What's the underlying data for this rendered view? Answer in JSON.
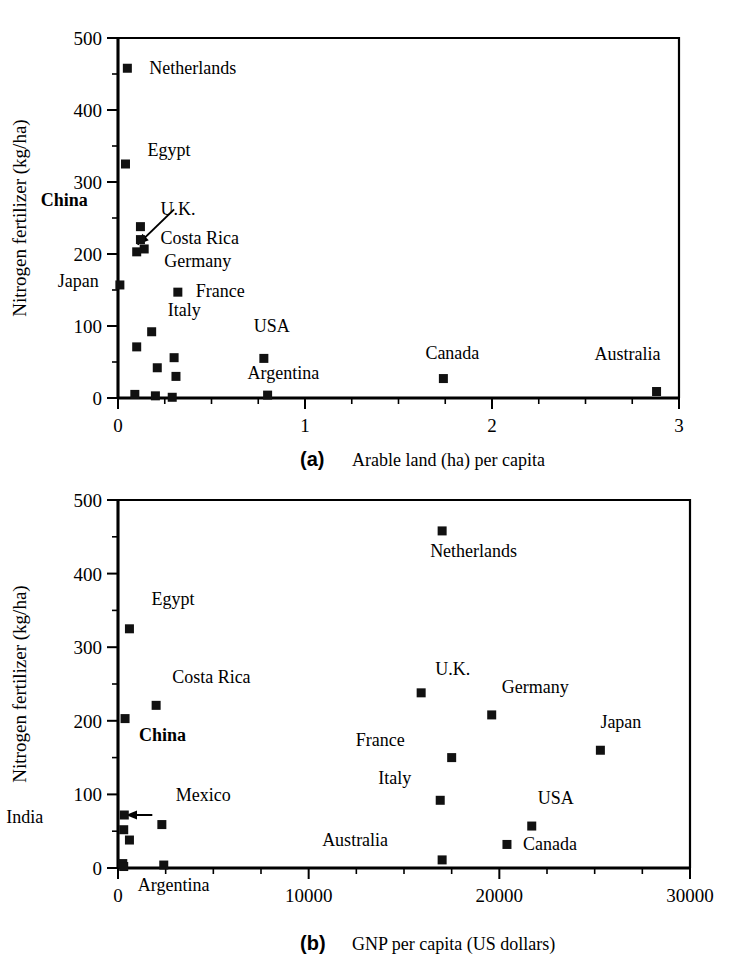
{
  "figure": {
    "background_color": "#ffffff",
    "marker_color": "#111111"
  },
  "chart_data": [
    {
      "type": "scatter",
      "panel_tag": "(a)",
      "title": "",
      "xlabel": "Arable land (ha) per capita",
      "ylabel": "Nitrogen fertilizer (kg/ha)",
      "xlim": [
        0,
        3
      ],
      "ylim": [
        0,
        500
      ],
      "xticks": [
        0,
        1,
        2,
        3
      ],
      "xtick_labels": [
        "0",
        "1",
        "2",
        "3"
      ],
      "x_minor_step": 0.25,
      "yticks": [
        0,
        100,
        200,
        300,
        400,
        500
      ],
      "ytick_labels": [
        "0",
        "100",
        "200",
        "300",
        "400",
        "500"
      ],
      "y_minor_step": 50,
      "grid": false,
      "legend": "none",
      "points": [
        {
          "label": "Netherlands",
          "x": 0.05,
          "y": 458,
          "label_dx": 22,
          "label_dy": 6,
          "bold": false
        },
        {
          "label": "Egypt",
          "x": 0.04,
          "y": 325,
          "label_dx": 22,
          "label_dy": -8,
          "bold": false
        },
        {
          "label": "U.K.",
          "x": 0.12,
          "y": 238,
          "label_dx": 20,
          "label_dy": -12,
          "bold": false
        },
        {
          "label": "Costa Rica",
          "x": 0.12,
          "y": 220,
          "label_dx": 20,
          "label_dy": 4,
          "bold": false
        },
        {
          "label": "Germany",
          "x": 0.14,
          "y": 207,
          "label_dx": 20,
          "label_dy": 18,
          "bold": false
        },
        {
          "label": "China",
          "x": 0.1,
          "y": 203,
          "label_dx": -96,
          "label_dy": -46,
          "bold": true
        },
        {
          "label": "Japan",
          "x": 0.01,
          "y": 157,
          "label_dx": -62,
          "label_dy": 2,
          "bold": false
        },
        {
          "label": "France",
          "x": 0.32,
          "y": 147,
          "label_dx": 18,
          "label_dy": 5,
          "bold": false
        },
        {
          "label": "Italy",
          "x": 0.18,
          "y": 92,
          "label_dx": 16,
          "label_dy": -16,
          "bold": false
        },
        {
          "label": "",
          "x": 0.1,
          "y": 71,
          "label_dx": 0,
          "label_dy": 0,
          "bold": false
        },
        {
          "label": "USA",
          "x": 0.78,
          "y": 55,
          "label_dx": -10,
          "label_dy": -26,
          "bold": false
        },
        {
          "label": "",
          "x": 0.3,
          "y": 56,
          "label_dx": 0,
          "label_dy": 0,
          "bold": false
        },
        {
          "label": "",
          "x": 0.21,
          "y": 42,
          "label_dx": 0,
          "label_dy": 0,
          "bold": false
        },
        {
          "label": "",
          "x": 0.31,
          "y": 30,
          "label_dx": 0,
          "label_dy": 0,
          "bold": false
        },
        {
          "label": "Canada",
          "x": 1.74,
          "y": 27,
          "label_dx": -18,
          "label_dy": -20,
          "bold": false
        },
        {
          "label": "Australia",
          "x": 2.88,
          "y": 9,
          "label_dx": -62,
          "label_dy": -32,
          "bold": false
        },
        {
          "label": "Argentina",
          "x": 0.8,
          "y": 4,
          "label_dx": -20,
          "label_dy": -16,
          "bold": false
        },
        {
          "label": "",
          "x": 0.09,
          "y": 5,
          "label_dx": 0,
          "label_dy": 0,
          "bold": false
        },
        {
          "label": "",
          "x": 0.2,
          "y": 3,
          "label_dx": 0,
          "label_dy": 0,
          "bold": false
        },
        {
          "label": "",
          "x": 0.29,
          "y": 1,
          "label_dx": 0,
          "label_dy": 0,
          "bold": false
        }
      ],
      "annotations": [
        {
          "text": "China",
          "type": "arrow-leader",
          "from": [
            0.3,
            262
          ],
          "to": [
            0.105,
            213
          ]
        }
      ]
    },
    {
      "type": "scatter",
      "panel_tag": "(b)",
      "title": "",
      "xlabel": "GNP per capita (US dollars)",
      "ylabel": "Nitrogen fertilizer (kg/ha)",
      "xlim": [
        0,
        30000
      ],
      "ylim": [
        0,
        500
      ],
      "xticks": [
        0,
        10000,
        20000,
        30000
      ],
      "xtick_labels": [
        "0",
        "10000",
        "20000",
        "30000"
      ],
      "x_minor_step": 2500,
      "yticks": [
        0,
        100,
        200,
        300,
        400,
        500
      ],
      "ytick_labels": [
        "0",
        "100",
        "200",
        "300",
        "400",
        "500"
      ],
      "y_minor_step": 50,
      "grid": false,
      "legend": "none",
      "points": [
        {
          "label": "Netherlands",
          "x": 17000,
          "y": 458,
          "label_dx": -12,
          "label_dy": 26,
          "bold": false
        },
        {
          "label": "Egypt",
          "x": 600,
          "y": 325,
          "label_dx": 22,
          "label_dy": -24,
          "bold": false
        },
        {
          "label": "Costa Rica",
          "x": 2000,
          "y": 221,
          "label_dx": 16,
          "label_dy": -22,
          "bold": false
        },
        {
          "label": "China",
          "x": 370,
          "y": 203,
          "label_dx": 14,
          "label_dy": 22,
          "bold": true
        },
        {
          "label": "U.K.",
          "x": 15900,
          "y": 238,
          "label_dx": 14,
          "label_dy": -18,
          "bold": false
        },
        {
          "label": "Germany",
          "x": 19600,
          "y": 208,
          "label_dx": 10,
          "label_dy": -22,
          "bold": false
        },
        {
          "label": "France",
          "x": 17500,
          "y": 150,
          "label_dx": -96,
          "label_dy": -12,
          "bold": false
        },
        {
          "label": "Japan",
          "x": 25300,
          "y": 160,
          "label_dx": 0,
          "label_dy": -22,
          "bold": false
        },
        {
          "label": "Italy",
          "x": 16900,
          "y": 92,
          "label_dx": -62,
          "label_dy": -16,
          "bold": false
        },
        {
          "label": "Mexico",
          "x": 2300,
          "y": 59,
          "label_dx": 14,
          "label_dy": -24,
          "bold": false
        },
        {
          "label": "USA",
          "x": 21700,
          "y": 57,
          "label_dx": 6,
          "label_dy": -22,
          "bold": false
        },
        {
          "label": "Canada",
          "x": 20400,
          "y": 32,
          "label_dx": 16,
          "label_dy": 6,
          "bold": false
        },
        {
          "label": "Australia",
          "x": 17000,
          "y": 11,
          "label_dx": -120,
          "label_dy": -14,
          "bold": false
        },
        {
          "label": "Argentina",
          "x": 2400,
          "y": 4,
          "label_dx": -26,
          "label_dy": 26,
          "bold": false
        },
        {
          "label": "India",
          "x": 330,
          "y": 72,
          "label_dx": -118,
          "label_dy": 8,
          "bold": false
        },
        {
          "label": "",
          "x": 300,
          "y": 52,
          "label_dx": 0,
          "label_dy": 0,
          "bold": false
        },
        {
          "label": "",
          "x": 600,
          "y": 38,
          "label_dx": 0,
          "label_dy": 0,
          "bold": false
        },
        {
          "label": "",
          "x": 250,
          "y": 6,
          "label_dx": 0,
          "label_dy": 0,
          "bold": false
        },
        {
          "label": "",
          "x": 300,
          "y": 2,
          "label_dx": 0,
          "label_dy": 0,
          "bold": false
        }
      ],
      "annotations": [
        {
          "text": "India",
          "type": "arrow-leader",
          "from": [
            1800,
            72
          ],
          "to": [
            420,
            72
          ]
        }
      ]
    }
  ]
}
